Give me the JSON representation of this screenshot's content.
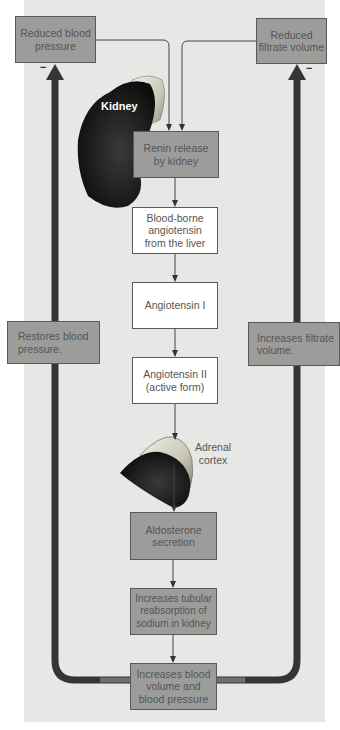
{
  "diagram": {
    "stimuli": {
      "left": "Reduced blood pressure",
      "right": "Reduced filtrate volume"
    },
    "organ_labels": {
      "kidney": "Kidney",
      "adrenal": "Adrenal cortex"
    },
    "steps": [
      {
        "label": "Renin release by kidney",
        "style": "dark"
      },
      {
        "label": "Blood-borne angiotensin from the liver",
        "style": "light"
      },
      {
        "label": "Angiotensin I",
        "style": "light"
      },
      {
        "label": "Angiotensin II (active form)",
        "style": "light"
      },
      {
        "label": "Aldosterone secretion",
        "style": "dark"
      },
      {
        "label": "Increases tubular reabsorption of sodium in kidney",
        "style": "dark"
      },
      {
        "label": "Increases blood volume and blood pressure",
        "style": "dark"
      }
    ],
    "feedback": {
      "left": "Restores blood pressure.",
      "right": "Increases filtrate volume.",
      "sign_left": "−",
      "sign_right": "−"
    },
    "colors": {
      "panel": "#e7e7e5",
      "dark_box": "#9c9c9b",
      "light_box": "#ffffff",
      "loop": "#3a3a3a",
      "text": "#555555"
    }
  }
}
